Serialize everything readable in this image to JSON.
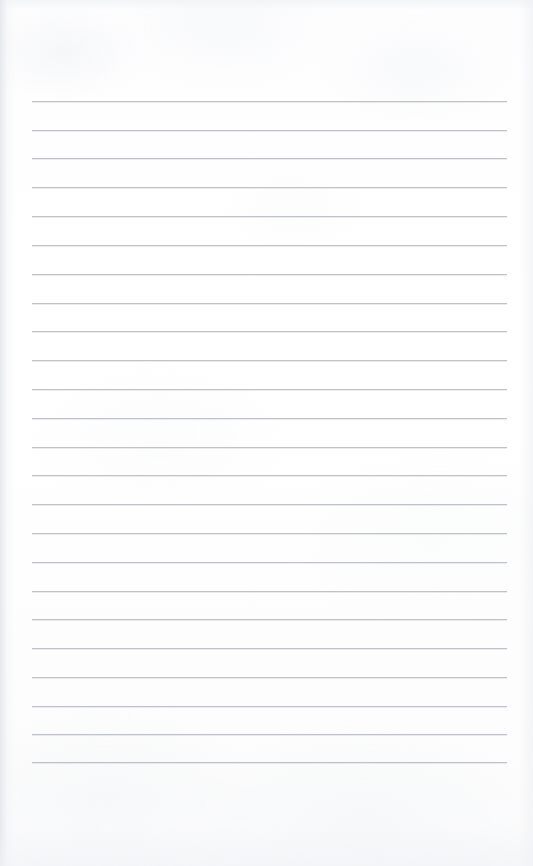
{
  "document": {
    "kind": "lined-notepad-page",
    "title": "Blank Lined Notebook Page",
    "content_text": "",
    "page_width": 533,
    "page_height": 866,
    "paper_color": "#fdfdfd",
    "rule_color": "#babec4",
    "edge_shadow_color": "#e2e5e9"
  },
  "ruling": {
    "line_count": 24,
    "first_line_y": 101,
    "line_spacing": 28.8,
    "line_left_x": 32,
    "line_right_x": 507,
    "line_width": 475,
    "line_thickness": 1,
    "top_margin": 101,
    "bottom_margin": 104,
    "lines_y": [
      101,
      130,
      158,
      187,
      216,
      245,
      274,
      303,
      331,
      360,
      389,
      418,
      447,
      475,
      504,
      533,
      562,
      591,
      619,
      648,
      677,
      706,
      734,
      762
    ]
  },
  "lines": [
    {
      "index": 1,
      "text": ""
    },
    {
      "index": 2,
      "text": ""
    },
    {
      "index": 3,
      "text": ""
    },
    {
      "index": 4,
      "text": ""
    },
    {
      "index": 5,
      "text": ""
    },
    {
      "index": 6,
      "text": ""
    },
    {
      "index": 7,
      "text": ""
    },
    {
      "index": 8,
      "text": ""
    },
    {
      "index": 9,
      "text": ""
    },
    {
      "index": 10,
      "text": ""
    },
    {
      "index": 11,
      "text": ""
    },
    {
      "index": 12,
      "text": ""
    },
    {
      "index": 13,
      "text": ""
    },
    {
      "index": 14,
      "text": ""
    },
    {
      "index": 15,
      "text": ""
    },
    {
      "index": 16,
      "text": ""
    },
    {
      "index": 17,
      "text": ""
    },
    {
      "index": 18,
      "text": ""
    },
    {
      "index": 19,
      "text": ""
    },
    {
      "index": 20,
      "text": ""
    },
    {
      "index": 21,
      "text": ""
    },
    {
      "index": 22,
      "text": ""
    },
    {
      "index": 23,
      "text": ""
    },
    {
      "index": 24,
      "text": ""
    }
  ]
}
